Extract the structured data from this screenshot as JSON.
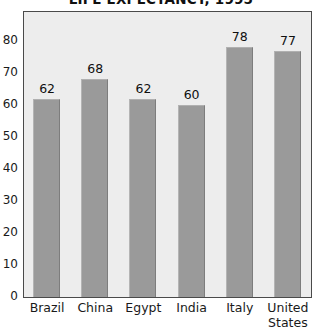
{
  "chart_data": {
    "type": "bar",
    "title": "LIFE EXPECTANCY, 1995",
    "xlabel": "",
    "ylabel": "",
    "categories": [
      "Brazil",
      "China",
      "Egypt",
      "India",
      "Italy",
      "United States"
    ],
    "values": [
      62,
      68,
      62,
      60,
      78,
      77
    ],
    "data_labels": [
      "62",
      "68",
      "62",
      "60",
      "78",
      "77"
    ],
    "ylim": [
      0,
      80
    ],
    "ytick_step": 10,
    "ytick_labels": [
      "80",
      "70",
      "60",
      "50",
      "40",
      "30",
      "20",
      "10",
      "0"
    ],
    "ytick_values": [
      80,
      70,
      60,
      50,
      40,
      30,
      20,
      10,
      0
    ],
    "grid": false,
    "legend": false,
    "legend_position": "none",
    "series": [
      {
        "name": "Life expectancy (years)",
        "values": [
          62,
          68,
          62,
          60,
          78,
          77
        ]
      }
    ],
    "colors": {
      "bar_fill": "#9a9a9a",
      "plot_background": "#ededed",
      "frame": "#4a4a4a",
      "page_background": "#ffffff",
      "text": "#1a1a1a"
    }
  }
}
